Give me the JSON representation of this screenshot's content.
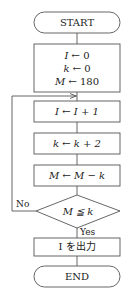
{
  "flowchart": {
    "start": {
      "label": "START"
    },
    "init": {
      "lines": [
        {
          "var": "I",
          "arrow": "←",
          "expr": "0"
        },
        {
          "var": "k",
          "arrow": "←",
          "expr": "0"
        },
        {
          "var": "M",
          "arrow": "←",
          "expr": "180"
        }
      ]
    },
    "steps": [
      {
        "var": "I",
        "arrow": "←",
        "expr": "I + 1"
      },
      {
        "var": "k",
        "arrow": "←",
        "expr": "k + 2"
      },
      {
        "var": "M",
        "arrow": "←",
        "expr": "M − k"
      }
    ],
    "decision": {
      "condition": "M ≦ k",
      "no_label": "No",
      "yes_label": "Yes"
    },
    "output": {
      "label": "I を出力"
    },
    "end": {
      "label": "END"
    }
  },
  "colors": {
    "line": "#555555",
    "background": "#ffffff",
    "text": "#222222"
  }
}
